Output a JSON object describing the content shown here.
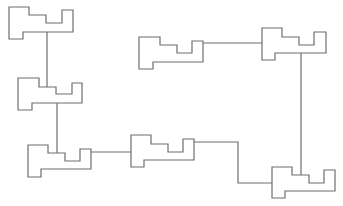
{
  "diagram": {
    "stroke_color": "#6e6e6e",
    "background": "#ffffff",
    "nodes": [
      {
        "id": "n1",
        "points": "9,7 29,7 29,15 46,15 46,23 62,23 62,10 73,10 73,32 23,32 23,39 9,39"
      },
      {
        "id": "n2",
        "points": "18,78 39,78 39,87 56,87 56,94 72,94 72,83 82,83 82,103 32,103 32,110 18,110"
      },
      {
        "id": "n3",
        "points": "28,145 48,145 48,153 65,153 65,161 80,161 80,149 91,149 91,169 41,169 41,177 28,177"
      },
      {
        "id": "n4",
        "points": "131,135 151,135 151,144 168,144 168,152 183,152 183,139 194,139 194,160 144,160 144,167 131,167"
      },
      {
        "id": "n5",
        "points": "139,37 160,37 160,45 177,45 177,53 192,53 192,41 203,41 203,62 153,62 153,69 139,69"
      },
      {
        "id": "n6",
        "points": "262,28 282,28 282,37 299,37 299,45 314,45 314,32 326,32 326,53 275,53 275,60 262,60"
      },
      {
        "id": "n7",
        "points": "272,167 292,167 292,175 309,175 309,183 324,183 324,170 335,170 335,191 285,191 285,198 272,198"
      }
    ],
    "edges": [
      {
        "id": "e1",
        "points": "47,32 47,87"
      },
      {
        "id": "e2",
        "points": "57,103 57,161"
      },
      {
        "id": "e3",
        "points": "91,152 131,152"
      },
      {
        "id": "e4",
        "points": "194,142 238,142 238,183 272,183"
      },
      {
        "id": "e5",
        "points": "203,43 262,43"
      },
      {
        "id": "e6",
        "points": "301,53 301,175"
      }
    ]
  }
}
